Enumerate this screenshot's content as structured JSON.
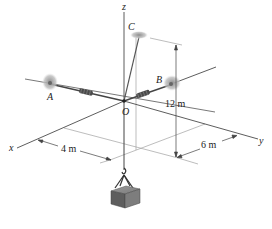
{
  "figure": {
    "axes": {
      "x_label": "x",
      "y_label": "y",
      "z_label": "z"
    },
    "points": {
      "A": "A",
      "B": "B",
      "C": "C",
      "O": "O"
    },
    "dimensions": {
      "height": "12 m",
      "x_offset": "4 m",
      "y_offset": "6 m"
    },
    "colors": {
      "line": "#333333",
      "light_line": "#9a9a9a",
      "mount": "#a8a8a8",
      "crate": "#6e6e6e"
    }
  }
}
